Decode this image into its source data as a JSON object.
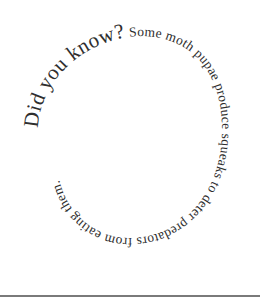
{
  "image": {
    "description": "Spiral text graphic",
    "segments": [
      {
        "text": "Did you know?",
        "size": 21
      },
      {
        "text": " Some moth pupae produce squeaks to deter predators from eating them.",
        "size": 13
      }
    ],
    "text_color": "#2e2e2e",
    "background": "#ffffff",
    "rule_color": "#7a7a7a"
  }
}
